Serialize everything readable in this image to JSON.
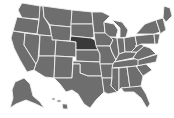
{
  "map": {
    "title": "United States",
    "highlighted_state": "Nebraska",
    "colors": {
      "state_fill": "#6e6e6e",
      "highlight_fill": "#3a3a3a",
      "border": "#f2f2f2",
      "background": "#ffffff"
    },
    "states": [
      "Washington",
      "Oregon",
      "California",
      "Nevada",
      "Idaho",
      "Montana",
      "Wyoming",
      "Utah",
      "Arizona",
      "Colorado",
      "New Mexico",
      "North Dakota",
      "South Dakota",
      "Nebraska",
      "Kansas",
      "Oklahoma",
      "Texas",
      "Minnesota",
      "Iowa",
      "Missouri",
      "Arkansas",
      "Louisiana",
      "Wisconsin",
      "Illinois",
      "Michigan",
      "Indiana",
      "Ohio",
      "Kentucky",
      "Tennessee",
      "Mississippi",
      "Alabama",
      "Georgia",
      "Florida",
      "South Carolina",
      "North Carolina",
      "Virginia",
      "West Virginia",
      "Pennsylvania",
      "New York",
      "Maine",
      "New England",
      "Alaska",
      "Hawaii"
    ]
  }
}
